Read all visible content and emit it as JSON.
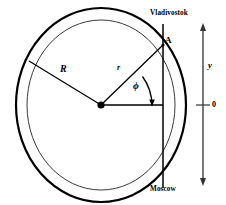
{
  "figure": {
    "labels": {
      "city_top": "Vladivostok",
      "city_bottom": "Moscow",
      "point_a": "A",
      "outer_radius": "R",
      "inner_radius": "r",
      "angle": "ϕ",
      "axis_y": "y",
      "axis_zero": "0"
    },
    "colors": {
      "stroke": "#000000",
      "background": "#ffffff",
      "axis": "#555555",
      "inner_circle": "#444444"
    },
    "geometry": {
      "center_x": 101,
      "center_y": 105,
      "outer_radius_x": 85,
      "outer_radius_y": 97,
      "inner_radius_x": 74,
      "inner_radius_y": 85,
      "chord_x": 163,
      "chord_top_y": 24,
      "chord_bottom_y": 188,
      "point_a_x": 163,
      "point_a_y": 45,
      "axis_x": 203,
      "axis_top_y": 24,
      "axis_bottom_y": 184,
      "axis_zero_y": 105,
      "angle_degrees": 43
    }
  }
}
